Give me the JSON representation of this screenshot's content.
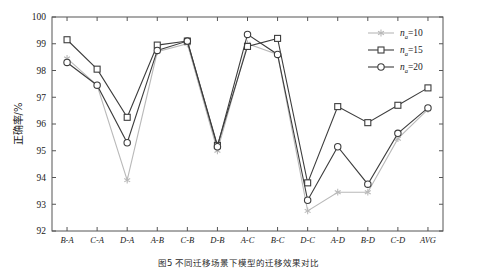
{
  "figure": {
    "caption": "图5  不同迁移场景下模型的迁移效果对比",
    "caption_prefix": "图5",
    "ylabel": "正确率/%"
  },
  "chart_data": {
    "type": "line",
    "title": "",
    "xlabel": "",
    "ylabel": "正确率/%",
    "ylim": [
      92,
      100
    ],
    "yticks": [
      92,
      93,
      94,
      95,
      96,
      97,
      98,
      99,
      100
    ],
    "grid": false,
    "legend_position": "top-right",
    "categories": [
      "B-A",
      "C-A",
      "D-A",
      "A-B",
      "C-B",
      "D-B",
      "A-C",
      "B-C",
      "D-C",
      "A-D",
      "B-D",
      "C-D",
      "AVG"
    ],
    "series": [
      {
        "name": "n_a=10",
        "label_base": "n",
        "label_sub": "a",
        "label_value": "=10",
        "color": "#b9b9b9",
        "marker": "star",
        "values": [
          98.45,
          97.45,
          93.9,
          98.7,
          99.0,
          95.0,
          99.0,
          98.6,
          92.75,
          93.45,
          93.45,
          95.45,
          96.55
        ]
      },
      {
        "name": "n_a=15",
        "label_base": "n",
        "label_sub": "a",
        "label_value": "=15",
        "color": "#3d3d3d",
        "marker": "square",
        "values": [
          99.15,
          98.05,
          96.25,
          98.95,
          99.1,
          95.2,
          98.9,
          99.2,
          93.8,
          96.65,
          96.05,
          96.7,
          97.35
        ]
      },
      {
        "name": "n_a=20",
        "label_base": "n",
        "label_sub": "a",
        "label_value": "=20",
        "color": "#3d3d3d",
        "marker": "circle",
        "values": [
          98.3,
          97.45,
          95.3,
          98.75,
          99.1,
          95.15,
          99.35,
          98.6,
          93.15,
          95.15,
          93.75,
          95.65,
          96.6
        ]
      }
    ]
  }
}
